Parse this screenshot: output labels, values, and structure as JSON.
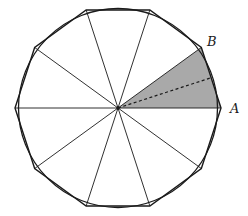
{
  "figure": {
    "center": [
      118,
      108
    ],
    "polygon_sides": 10,
    "vertex_radius": 103,
    "circle_radius": 99.5,
    "shaded_sector": {
      "from_vertex": "A",
      "to_vertex": "B",
      "fill": "#a9a9a9"
    },
    "labels": [
      {
        "id": "A",
        "text": "A",
        "x": 230,
        "y": 113
      },
      {
        "id": "B",
        "text": "B",
        "x": 207,
        "y": 46
      }
    ],
    "colors": {
      "stroke": "#1a1a1a",
      "shade": "#a9a9a9",
      "background": "#ffffff"
    }
  }
}
